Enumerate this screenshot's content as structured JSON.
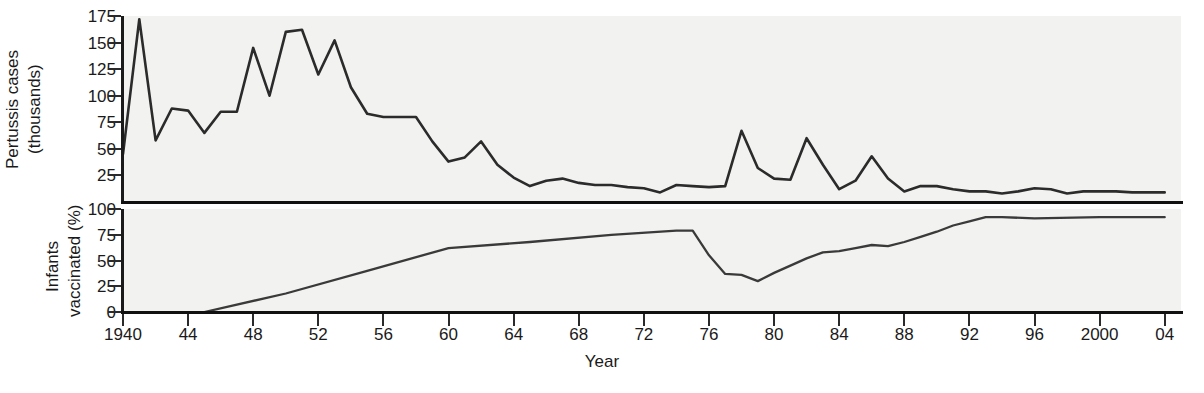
{
  "figure": {
    "xlabel": "Year",
    "background": "#f2f2f0",
    "line_color": "#2b2b2b"
  },
  "panels": {
    "cases": {
      "ylabel_line1": "Pertussis cases",
      "ylabel_line2": "(thousands)",
      "yticks": [
        175,
        150,
        125,
        100,
        75,
        50,
        25
      ],
      "ylim": [
        0,
        175
      ]
    },
    "vaccination": {
      "ylabel_line1": "Infants",
      "ylabel_line2": "vaccinated (%)",
      "yticks": [
        100,
        75,
        50,
        25,
        0
      ],
      "ylim": [
        0,
        100
      ]
    }
  },
  "xaxis": {
    "xlim": [
      1940,
      2005
    ],
    "tick_years": [
      1940,
      1944,
      1948,
      1952,
      1956,
      1960,
      1964,
      1968,
      1972,
      1976,
      1980,
      1984,
      1988,
      1992,
      1996,
      2000,
      2004
    ],
    "tick_labels": [
      "1940",
      "44",
      "48",
      "52",
      "56",
      "60",
      "64",
      "68",
      "72",
      "76",
      "80",
      "84",
      "88",
      "92",
      "96",
      "2000",
      "04"
    ]
  },
  "chart_data": [
    {
      "type": "line",
      "title": "Pertussis cases (thousands) by year",
      "xlabel": "Year",
      "ylabel": "Pertussis cases (thousands)",
      "xlim": [
        1940,
        2005
      ],
      "ylim": [
        0,
        175
      ],
      "grid": false,
      "legend": "none",
      "x": [
        1940,
        1941,
        1942,
        1943,
        1944,
        1945,
        1946,
        1947,
        1948,
        1949,
        1950,
        1951,
        1952,
        1953,
        1954,
        1955,
        1956,
        1957,
        1958,
        1959,
        1960,
        1961,
        1962,
        1963,
        1964,
        1965,
        1966,
        1967,
        1968,
        1969,
        1970,
        1971,
        1972,
        1973,
        1974,
        1975,
        1976,
        1977,
        1978,
        1979,
        1980,
        1981,
        1982,
        1983,
        1984,
        1985,
        1986,
        1987,
        1988,
        1989,
        1990,
        1991,
        1992,
        1993,
        1994,
        1995,
        1996,
        1997,
        1998,
        1999,
        2000,
        2001,
        2002,
        2003,
        2004
      ],
      "values": [
        45,
        172,
        58,
        88,
        86,
        65,
        85,
        85,
        145,
        100,
        160,
        162,
        120,
        152,
        108,
        83,
        80,
        80,
        80,
        57,
        38,
        42,
        57,
        35,
        23,
        15,
        20,
        22,
        18,
        16,
        16,
        14,
        13,
        9,
        16,
        15,
        14,
        15,
        67,
        32,
        22,
        21,
        60,
        35,
        12,
        20,
        43,
        22,
        10,
        15,
        15,
        12,
        10,
        10,
        8,
        10,
        13,
        12,
        8,
        10,
        10,
        10,
        9,
        9,
        9
      ],
      "annotations": []
    },
    {
      "type": "line",
      "title": "Infants vaccinated (%) by year",
      "xlabel": "Year",
      "ylabel": "Infants vaccinated (%)",
      "xlim": [
        1940,
        2005
      ],
      "ylim": [
        0,
        100
      ],
      "grid": false,
      "legend": "none",
      "x": [
        1945,
        1950,
        1955,
        1960,
        1965,
        1970,
        1974,
        1975,
        1976,
        1977,
        1978,
        1979,
        1980,
        1981,
        1982,
        1983,
        1984,
        1985,
        1986,
        1987,
        1988,
        1989,
        1990,
        1991,
        1992,
        1993,
        1994,
        1996,
        2000,
        2004
      ],
      "values": [
        0,
        18,
        40,
        62,
        68,
        75,
        79,
        79,
        55,
        37,
        36,
        30,
        38,
        45,
        52,
        58,
        59,
        62,
        65,
        64,
        68,
        73,
        78,
        84,
        88,
        92,
        92,
        91,
        92,
        92
      ],
      "annotations": []
    }
  ]
}
